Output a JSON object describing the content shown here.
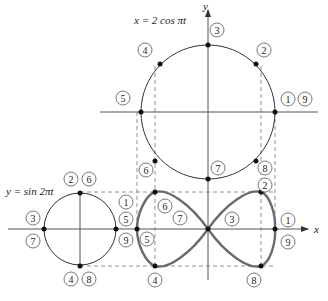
{
  "equations": {
    "x_param": "x = 2 cos πt",
    "y_param": "y = sin 2πt"
  },
  "axes": {
    "x_label": "x",
    "y_label": "y"
  },
  "colors": {
    "curve": "#6b6b6b",
    "circle": "#333333",
    "axis": "#555555",
    "dashed": "#777777",
    "point": "#111111"
  },
  "top_circle": {
    "description": "Reference circle generating x = 2 cos πt",
    "labels": [
      {
        "id": "3",
        "text": "3"
      },
      {
        "id": "2",
        "text": "2"
      },
      {
        "id": "4",
        "text": "4"
      },
      {
        "id": "5",
        "text": "5"
      },
      {
        "id": "1",
        "text": "1"
      },
      {
        "id": "9",
        "text": "9"
      },
      {
        "id": "6",
        "text": "6"
      },
      {
        "id": "7",
        "text": "7"
      },
      {
        "id": "8",
        "text": "8"
      }
    ]
  },
  "left_circle": {
    "description": "Reference circle generating y = sin 2πt",
    "labels": [
      {
        "id": "2",
        "text": "2"
      },
      {
        "id": "6",
        "text": "6"
      },
      {
        "id": "3",
        "text": "3"
      },
      {
        "id": "7",
        "text": "7"
      },
      {
        "id": "1",
        "text": "1"
      },
      {
        "id": "5",
        "text": "5"
      },
      {
        "id": "9",
        "text": "9"
      },
      {
        "id": "4",
        "text": "4"
      },
      {
        "id": "8",
        "text": "8"
      }
    ]
  },
  "lissajous": {
    "description": "Figure-eight curve traced by (2 cos πt, sin 2πt)",
    "labels": [
      {
        "id": "6",
        "text": "6"
      },
      {
        "id": "7",
        "text": "7"
      },
      {
        "id": "5",
        "text": "5"
      },
      {
        "id": "4",
        "text": "4"
      },
      {
        "id": "3",
        "text": "3"
      },
      {
        "id": "2",
        "text": "2"
      },
      {
        "id": "1",
        "text": "1"
      },
      {
        "id": "9",
        "text": "9"
      },
      {
        "id": "8",
        "text": "8"
      }
    ]
  }
}
